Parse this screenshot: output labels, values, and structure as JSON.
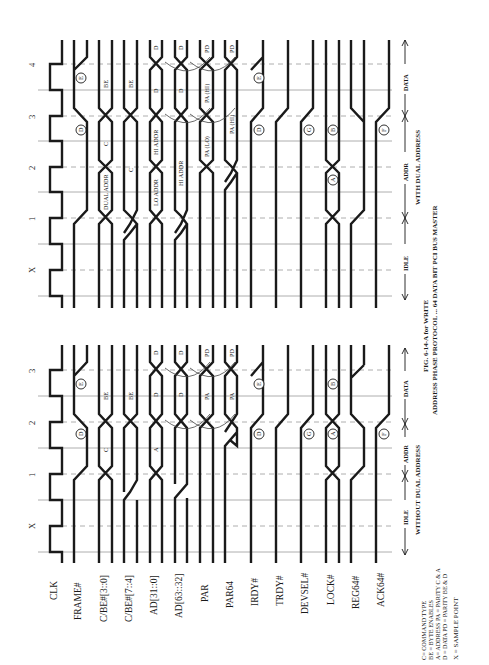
{
  "signals": [
    {
      "name": "CLK"
    },
    {
      "name": "FRAME#"
    },
    {
      "name": "C/BE#[3::0]"
    },
    {
      "name": "C/BE#[7::4]"
    },
    {
      "name": "AD[31::0]"
    },
    {
      "name": "AD[63::32]"
    },
    {
      "name": "PAR"
    },
    {
      "name": "PAR64"
    },
    {
      "name": "IRDY#"
    },
    {
      "name": "TRDY#"
    },
    {
      "name": "DEVSEL#"
    },
    {
      "name": "LOCK#"
    },
    {
      "name": "REG64#"
    },
    {
      "name": "ACK64#"
    }
  ],
  "panels": {
    "without_dual": {
      "title": "WITHOUT DUAL ADDRESS",
      "clock_labels": [
        "X",
        "1",
        "2",
        "3"
      ],
      "phases": [
        "IDLE",
        "ADDR",
        "DATA"
      ],
      "bus_values": {
        "cbe_lo": [
          "C",
          "BE"
        ],
        "cbe_hi": [
          "BE"
        ],
        "ad_lo": [
          "A",
          "D",
          "D"
        ],
        "ad_hi": [
          "D",
          "D"
        ],
        "par": [
          "PA",
          "PD"
        ],
        "par64": [
          "PA",
          "PD"
        ]
      },
      "markers": [
        "D",
        "E",
        "D",
        "E",
        "G",
        "A",
        "B",
        "F"
      ]
    },
    "with_dual": {
      "title": "WITH DUAL ADDRESS",
      "clock_labels": [
        "X",
        "1",
        "2",
        "3",
        "4"
      ],
      "phases": [
        "IDLE",
        "ADDR",
        "DATA"
      ],
      "bus_values": {
        "cbe_lo": [
          "DUAL ADDR",
          "C",
          "BE"
        ],
        "cbe_hi": [
          "C",
          "BE"
        ],
        "ad_lo": [
          "LO ADDR",
          "HI ADDR",
          "D",
          "D"
        ],
        "ad_hi": [
          "HI ADDR",
          "D",
          "D"
        ],
        "par": [
          "PA (LO)",
          "PA (HI)",
          "PD"
        ],
        "par64": [
          "PA (HI)",
          "PD"
        ]
      },
      "markers": [
        "D",
        "E",
        "D",
        "E",
        "G",
        "A",
        "B",
        "F"
      ]
    }
  },
  "legend": {
    "lines": [
      "C= COMMAND TYPE",
      "BE = BYTE ENABLES",
      "A= ADDRESS     PA = PARITY  C & A",
      "D = DATA         PD = PARITY  BE & D"
    ],
    "sample": "X = SAMPLE POINT"
  },
  "caption": {
    "fig": "FIG. 6-14-A for WRITE",
    "title": "ADDRESS PHASE PROTOCOL ... 64 DATA BIT PCI BUS MASTER"
  },
  "colors": {
    "ink": "#1a1a1a",
    "grid": "#9a9a9a",
    "background": "#ffffff"
  }
}
